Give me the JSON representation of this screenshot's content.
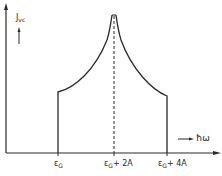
{
  "diagram": {
    "type": "density-of-states plot",
    "y_axis_label": "J",
    "y_axis_label_sub": "vc",
    "x_axis_label": "ħω",
    "x_ticks": [
      {
        "label": "ε",
        "sub": "G",
        "suffix": ""
      },
      {
        "label": "ε",
        "sub": "G",
        "suffix": "+ 2A"
      },
      {
        "label": "ε",
        "sub": "G",
        "suffix": "+ 4A"
      }
    ],
    "colors": {
      "line": "#2a2a2a",
      "background": "#ffffff"
    },
    "features": {
      "left_step": "vertical edge at εG",
      "center_peak": "singular peak at εG + 2A with dashed vertical line",
      "right_step": "vertical edge at εG + 4A"
    }
  }
}
